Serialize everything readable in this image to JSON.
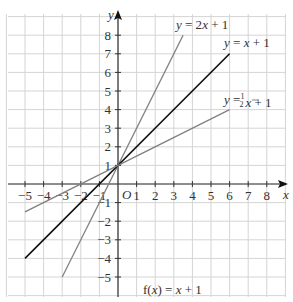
{
  "chart_data": {
    "type": "line",
    "title": "",
    "xlabel": "x",
    "ylabel": "y",
    "origin_label": "O",
    "xlim": [
      -5,
      8
    ],
    "ylim": [
      -5,
      8
    ],
    "grid": true,
    "x_ticks": [
      -5,
      -4,
      -3,
      -2,
      -1,
      1,
      2,
      3,
      4,
      5,
      6,
      7,
      8
    ],
    "y_ticks": [
      -5,
      -4,
      -3,
      -2,
      -1,
      1,
      2,
      3,
      4,
      5,
      6,
      7,
      8
    ],
    "series": [
      {
        "name": "y = 2x + 1",
        "x": [
          -3,
          3.5
        ],
        "y": [
          -5,
          8
        ],
        "color": "#808080"
      },
      {
        "name": "y = x + 1",
        "x": [
          -5,
          6
        ],
        "y": [
          -4,
          7
        ],
        "color": "#111111"
      },
      {
        "name": "y = 1/2 x + 1",
        "x": [
          -5,
          6
        ],
        "y": [
          -1.5,
          4
        ],
        "color": "#808080"
      }
    ],
    "annotations": [
      {
        "text": "y = 2x + 1"
      },
      {
        "text": "y = x + 1"
      },
      {
        "text": "y = ½x + 1"
      },
      {
        "text": "f(x) = x + 1"
      }
    ]
  },
  "labels": {
    "x_axis": "x",
    "y_axis": "y",
    "origin": "O",
    "line_2x": "y = 2x + 1",
    "line_x": "y = x + 1",
    "line_half_prefix": "y = ",
    "line_half_suffix": "x + 1",
    "func": "f(x) = x + 1"
  }
}
